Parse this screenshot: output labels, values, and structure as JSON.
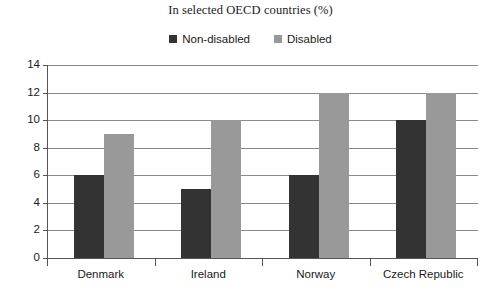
{
  "chart_data": {
    "type": "bar",
    "title": "In selected OECD countries (%)",
    "xlabel": "",
    "ylabel": "",
    "categories": [
      "Denmark",
      "Ireland",
      "Norway",
      "Czech Republic"
    ],
    "series": [
      {
        "name": "Non-disabled",
        "color": "#333333",
        "values": [
          6,
          5,
          6,
          10
        ]
      },
      {
        "name": "Disabled",
        "color": "#999999",
        "values": [
          9,
          10,
          12,
          12
        ]
      }
    ],
    "ylim": [
      0,
      14
    ],
    "ytick_labels": [
      "0",
      "2",
      "4",
      "6",
      "8",
      "10",
      "12",
      "14"
    ],
    "ytick_values": [
      0,
      2,
      4,
      6,
      8,
      10,
      12,
      14
    ],
    "grid": true,
    "legend_position": "top-center"
  },
  "legend": {
    "entries": [
      {
        "label": "Non-disabled",
        "swatch": "dark-square-swatch"
      },
      {
        "label": "Disabled",
        "swatch": "gray-square-swatch"
      }
    ]
  },
  "colors": {
    "non_disabled": "#333333",
    "disabled": "#999999",
    "axis": "#555555",
    "gridline": "#8a8a8a",
    "text": "#1a1a1a",
    "background": "#ffffff"
  }
}
